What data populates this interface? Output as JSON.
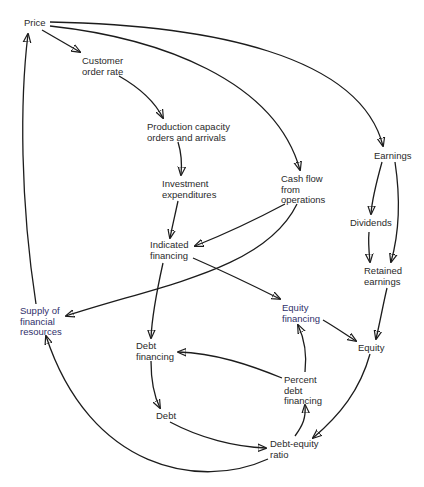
{
  "diagram": {
    "type": "causal-loop",
    "nodes": [
      {
        "id": "price",
        "label": "Price",
        "x": 24,
        "y": 19
      },
      {
        "id": "customer_order_rate",
        "label": "Customer\norder rate",
        "x": 82,
        "y": 56
      },
      {
        "id": "production_capacity",
        "label": "Production capacity\norders and arrivals",
        "x": 147,
        "y": 122
      },
      {
        "id": "investment_expenditures",
        "label": "Investment\nexpenditures",
        "x": 162,
        "y": 179
      },
      {
        "id": "cash_flow",
        "label": "Cash flow\nfrom\noperations",
        "x": 281,
        "y": 174
      },
      {
        "id": "earnings",
        "label": "Earnings",
        "x": 374,
        "y": 150
      },
      {
        "id": "dividends",
        "label": "Dividends",
        "x": 350,
        "y": 218
      },
      {
        "id": "retained_earnings",
        "label": "Retained\nearnings",
        "x": 364,
        "y": 266
      },
      {
        "id": "indicated_financing",
        "label": "Indicated\nfinancing",
        "x": 150,
        "y": 240
      },
      {
        "id": "supply_financial_resources",
        "label": "Supply of\nfinancial\nresources",
        "x": 20,
        "y": 306
      },
      {
        "id": "equity_financing",
        "label": "Equity\nfinancing",
        "x": 282,
        "y": 303
      },
      {
        "id": "equity",
        "label": "Equity",
        "x": 358,
        "y": 342
      },
      {
        "id": "debt_financing",
        "label": "Debt\nfinancing",
        "x": 136,
        "y": 341
      },
      {
        "id": "percent_debt_financing",
        "label": "Percent\ndebt\nfinancing",
        "x": 284,
        "y": 375
      },
      {
        "id": "debt",
        "label": "Debt",
        "x": 156,
        "y": 410
      },
      {
        "id": "debt_equity_ratio",
        "label": "Debt-equity\nratio",
        "x": 270,
        "y": 439
      }
    ],
    "edges": [
      {
        "from": "price",
        "to": "customer_order_rate"
      },
      {
        "from": "price",
        "to": "cash_flow"
      },
      {
        "from": "price",
        "to": "earnings"
      },
      {
        "from": "customer_order_rate",
        "to": "production_capacity"
      },
      {
        "from": "production_capacity",
        "to": "investment_expenditures"
      },
      {
        "from": "investment_expenditures",
        "to": "indicated_financing"
      },
      {
        "from": "cash_flow",
        "to": "indicated_financing"
      },
      {
        "from": "cash_flow",
        "to": "supply_financial_resources"
      },
      {
        "from": "earnings",
        "to": "dividends"
      },
      {
        "from": "earnings",
        "to": "retained_earnings"
      },
      {
        "from": "dividends",
        "to": "retained_earnings"
      },
      {
        "from": "retained_earnings",
        "to": "equity"
      },
      {
        "from": "indicated_financing",
        "to": "equity_financing"
      },
      {
        "from": "indicated_financing",
        "to": "debt_financing"
      },
      {
        "from": "equity_financing",
        "to": "equity"
      },
      {
        "from": "equity",
        "to": "debt_equity_ratio"
      },
      {
        "from": "percent_debt_financing",
        "to": "equity_financing"
      },
      {
        "from": "percent_debt_financing",
        "to": "debt_financing"
      },
      {
        "from": "debt_financing",
        "to": "debt"
      },
      {
        "from": "debt",
        "to": "debt_equity_ratio"
      },
      {
        "from": "debt_equity_ratio",
        "to": "percent_debt_financing"
      },
      {
        "from": "debt_equity_ratio",
        "to": "supply_financial_resources"
      },
      {
        "from": "supply_financial_resources",
        "to": "price"
      }
    ]
  },
  "labels": {
    "price": "Price",
    "customer_order_rate": "Customer\norder rate",
    "production_capacity": "Production capacity\norders and arrivals",
    "investment_expenditures": "Investment\nexpenditures",
    "cash_flow": "Cash flow\nfrom\noperations",
    "earnings": "Earnings",
    "dividends": "Dividends",
    "retained_earnings": "Retained\nearnings",
    "indicated_financing": "Indicated\nfinancing",
    "supply_financial_resources": "Supply of\nfinancial\nresources",
    "equity_financing": "Equity\nfinancing",
    "equity": "Equity",
    "debt_financing": "Debt\nfinancing",
    "percent_debt_financing": "Percent\ndebt\nfinancing",
    "debt": "Debt",
    "debt_equity_ratio": "Debt-equity\nratio"
  },
  "colors": {
    "line": "#1c1c1c",
    "text": "#2a2a2a",
    "highlight_text": "#2f2f6a",
    "background": "#ffffff"
  }
}
